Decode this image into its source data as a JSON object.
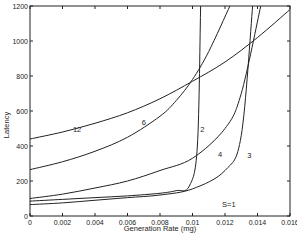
{
  "chart_data": {
    "type": "line",
    "title": "",
    "xlabel": "Generation Rate (mg)",
    "ylabel": "Latency",
    "xlim": [
      0,
      0.016
    ],
    "ylim": [
      0,
      1200
    ],
    "xticks": [
      "0",
      "0.002",
      "0.004",
      "0.006",
      "0.008",
      "0.01",
      "0.012",
      "0.014",
      "0.016"
    ],
    "yticks": [
      "0",
      "200",
      "400",
      "600",
      "800",
      "1000",
      "1200"
    ],
    "grid": false,
    "annotations": [
      "S=1"
    ],
    "series": [
      {
        "name": "12",
        "x": [
          0,
          0.002,
          0.004,
          0.006,
          0.008,
          0.01,
          0.012,
          0.014,
          0.016
        ],
        "y": [
          440,
          480,
          530,
          590,
          670,
          770,
          880,
          1020,
          1180
        ]
      },
      {
        "name": "6",
        "x": [
          0,
          0.002,
          0.004,
          0.006,
          0.008,
          0.009,
          0.01,
          0.011,
          0.0123
        ],
        "y": [
          265,
          310,
          370,
          450,
          570,
          660,
          780,
          940,
          1200
        ]
      },
      {
        "name": "4",
        "x": [
          0,
          0.002,
          0.004,
          0.006,
          0.008,
          0.01,
          0.012,
          0.013,
          0.0142
        ],
        "y": [
          100,
          125,
          160,
          200,
          260,
          330,
          500,
          700,
          1200
        ]
      },
      {
        "name": "2",
        "x": [
          0,
          0.002,
          0.004,
          0.006,
          0.008,
          0.009,
          0.0098,
          0.0103,
          0.0105
        ],
        "y": [
          85,
          95,
          105,
          115,
          130,
          145,
          170,
          400,
          1200
        ]
      },
      {
        "name": "3",
        "x": [
          0,
          0.002,
          0.004,
          0.006,
          0.008,
          0.01,
          0.012,
          0.013,
          0.0137
        ],
        "y": [
          65,
          75,
          90,
          105,
          120,
          155,
          260,
          460,
          1200
        ]
      }
    ],
    "curve_labels": [
      {
        "text": "12",
        "x": 0.0029,
        "y": 480
      },
      {
        "text": "6",
        "x": 0.007,
        "y": 520
      },
      {
        "text": "4",
        "x": 0.0117,
        "y": 340
      },
      {
        "text": "2",
        "x": 0.0106,
        "y": 480
      },
      {
        "text": "3",
        "x": 0.0135,
        "y": 330
      }
    ]
  }
}
